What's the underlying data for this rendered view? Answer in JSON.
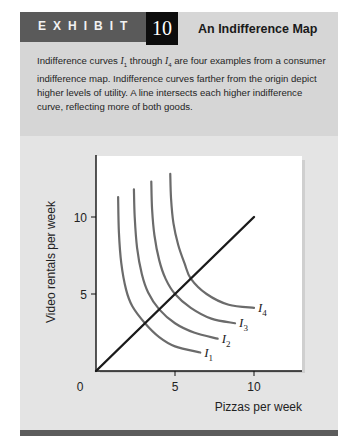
{
  "exhibit": {
    "label": "EXHIBIT",
    "number": "10",
    "title": "An Indifference Map"
  },
  "caption": {
    "part1": "Indifference curves ",
    "sym1": "I",
    "sub1": "1",
    "part2": " through ",
    "sym2": "I",
    "sub2": "4",
    "part3": " are four examples from a consumer indifference map. Indifference curves farther from the origin depict higher levels of utility. A line intersects each higher indifference curve, reflecting more of both goods."
  },
  "colors": {
    "panel": "#e4e4e4",
    "caption_bg": "#d6d6d6",
    "header_band": "#5a5a5a",
    "number_box": "#0d0d0d",
    "curve": "#6b6b6b",
    "line": "#1a1a1a",
    "plot_bg": "#ffffff",
    "bottom_bar": "#5c5c5c"
  },
  "chart_data": {
    "type": "line",
    "title": "An Indifference Map",
    "xlabel": "Pizzas per week",
    "ylabel": "Video rentals per week",
    "xlim": [
      0,
      13
    ],
    "ylim": [
      0,
      14
    ],
    "x_ticks": [
      0,
      5,
      10
    ],
    "y_ticks": [
      5,
      10
    ],
    "x_tick_labels": [
      "0",
      "5",
      "10"
    ],
    "y_tick_labels": [
      "5",
      "10"
    ],
    "grid": false,
    "legend": "inline labels at curve ends",
    "series": [
      {
        "name": "I1",
        "label": "I",
        "sub": "1",
        "points": [
          [
            1.4,
            11.3
          ],
          [
            1.45,
            9.0
          ],
          [
            1.6,
            7.0
          ],
          [
            1.9,
            5.3
          ],
          [
            2.3,
            4.2
          ],
          [
            3.1,
            3.1
          ],
          [
            4.0,
            2.2
          ],
          [
            5.0,
            1.6
          ],
          [
            6.6,
            1.2
          ]
        ]
      },
      {
        "name": "I2",
        "label": "I",
        "sub": "2",
        "points": [
          [
            2.4,
            11.8
          ],
          [
            2.45,
            10.0
          ],
          [
            2.6,
            8.0
          ],
          [
            2.9,
            6.3
          ],
          [
            3.3,
            5.1
          ],
          [
            4.0,
            4.0
          ],
          [
            5.0,
            3.1
          ],
          [
            6.2,
            2.5
          ],
          [
            7.7,
            2.1
          ]
        ]
      },
      {
        "name": "I3",
        "label": "I",
        "sub": "3",
        "points": [
          [
            3.5,
            12.3
          ],
          [
            3.55,
            10.5
          ],
          [
            3.7,
            8.8
          ],
          [
            4.0,
            7.2
          ],
          [
            4.4,
            6.0
          ],
          [
            5.0,
            5.0
          ],
          [
            6.0,
            4.1
          ],
          [
            7.3,
            3.4
          ],
          [
            8.8,
            3.1
          ]
        ]
      },
      {
        "name": "I4",
        "label": "I",
        "sub": "4",
        "points": [
          [
            4.7,
            12.8
          ],
          [
            4.75,
            11.2
          ],
          [
            4.9,
            9.6
          ],
          [
            5.2,
            8.2
          ],
          [
            5.6,
            7.0
          ],
          [
            6.0,
            6.0
          ],
          [
            7.0,
            5.0
          ],
          [
            8.4,
            4.3
          ],
          [
            10.0,
            4.1
          ]
        ]
      },
      {
        "name": "Line",
        "points": [
          [
            0,
            0
          ],
          [
            10,
            10
          ]
        ]
      }
    ]
  }
}
